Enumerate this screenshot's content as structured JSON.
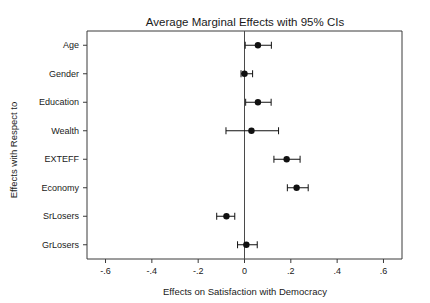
{
  "chart_data": {
    "type": "scatter",
    "title": "Average Marginal Effects with 95% CIs",
    "xlabel": "Effects on Satisfaction with Democracy",
    "ylabel": "Effects with Respect to",
    "orientation": "horizontal",
    "grid": false,
    "legend": "none",
    "xlim": [
      -0.68,
      0.68
    ],
    "xticks": [
      -0.6,
      -0.4,
      -0.2,
      0,
      0.2,
      0.4,
      0.6
    ],
    "xticklabels": [
      "-.6",
      "-.4",
      "-.2",
      "0",
      ".2",
      ".4",
      ".6"
    ],
    "reference_line": 0,
    "categories": [
      "Age",
      "Gender",
      "Education",
      "Wealth",
      "EXTEFF",
      "Economy",
      "SrLosers",
      "GrLosers"
    ],
    "values": [
      0.058,
      0.0,
      0.058,
      0.03,
      0.182,
      0.225,
      -0.078,
      0.008
    ],
    "ci_low": [
      0.003,
      -0.015,
      0.005,
      -0.08,
      0.127,
      0.185,
      -0.12,
      -0.03
    ],
    "ci_high": [
      0.116,
      0.035,
      0.115,
      0.147,
      0.24,
      0.275,
      -0.042,
      0.055
    ],
    "points": [
      {
        "category": "Age",
        "estimate": 0.058,
        "ci_low": 0.003,
        "ci_high": 0.116
      },
      {
        "category": "Gender",
        "estimate": 0.0,
        "ci_low": -0.015,
        "ci_high": 0.035
      },
      {
        "category": "Education",
        "estimate": 0.058,
        "ci_low": 0.005,
        "ci_high": 0.115
      },
      {
        "category": "Wealth",
        "estimate": 0.03,
        "ci_low": -0.08,
        "ci_high": 0.147
      },
      {
        "category": "EXTEFF",
        "estimate": 0.182,
        "ci_low": 0.127,
        "ci_high": 0.24
      },
      {
        "category": "Economy",
        "estimate": 0.225,
        "ci_low": 0.185,
        "ci_high": 0.275
      },
      {
        "category": "SrLosers",
        "estimate": -0.078,
        "ci_low": -0.12,
        "ci_high": -0.042
      },
      {
        "category": "GrLosers",
        "estimate": 0.008,
        "ci_low": -0.03,
        "ci_high": 0.055
      }
    ],
    "colors": {
      "marker": "#111111",
      "ci": "#111111",
      "frame": "#3a3a3a",
      "reference_line": "#4a4a4a",
      "background": "#ffffff",
      "text": "#1a1a1a"
    }
  }
}
